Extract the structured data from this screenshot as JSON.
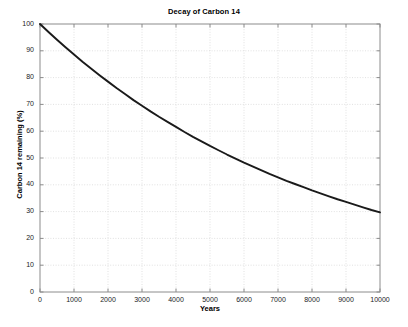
{
  "figure": {
    "background_color": "#ffffff",
    "axes_color": "#8c8c8c",
    "grid_color": "#d9d9d9",
    "line_color": "#1a1a1a",
    "text_color": "#000000"
  },
  "chart_data": {
    "type": "line",
    "title": "Decay of Carbon 14",
    "xlabel": "Years",
    "ylabel": "Carbon 14 remaining (%)",
    "xlim": [
      0,
      10000
    ],
    "ylim": [
      0,
      100
    ],
    "grid": true,
    "legend": null,
    "xticks": [
      0,
      1000,
      2000,
      3000,
      4000,
      5000,
      6000,
      7000,
      8000,
      9000,
      10000
    ],
    "xtick_labels": [
      "0",
      "1000",
      "2000",
      "3000",
      "4000",
      "5000",
      "6000",
      "7000",
      "8000",
      "9000",
      "10000"
    ],
    "yticks": [
      0,
      10,
      20,
      30,
      40,
      50,
      60,
      70,
      80,
      90,
      100
    ],
    "ytick_labels": [
      "0",
      "10",
      "20",
      "30",
      "40",
      "50",
      "60",
      "70",
      "80",
      "90",
      "100"
    ],
    "series": [
      {
        "name": "Carbon 14 remaining",
        "half_life_years": 5730,
        "color": "#1a1a1a",
        "line_width": 1.9,
        "x": [
          0,
          250,
          500,
          750,
          1000,
          1250,
          1500,
          1750,
          2000,
          2250,
          2500,
          2750,
          3000,
          3250,
          3500,
          3750,
          4000,
          4250,
          4500,
          4750,
          5000,
          5250,
          5500,
          5750,
          6000,
          6250,
          6500,
          6750,
          7000,
          7250,
          7500,
          7750,
          8000,
          8250,
          8500,
          8750,
          9000,
          9250,
          9500,
          9750,
          10000
        ],
        "y": [
          100.0,
          97.0,
          94.1,
          91.3,
          88.6,
          85.9,
          83.4,
          80.9,
          78.5,
          76.1,
          73.9,
          71.6,
          69.5,
          67.4,
          65.4,
          63.5,
          61.6,
          59.7,
          57.9,
          56.2,
          54.5,
          52.9,
          51.3,
          49.8,
          48.3,
          46.9,
          45.5,
          44.1,
          42.8,
          41.5,
          40.3,
          39.1,
          37.9,
          36.8,
          35.7,
          34.6,
          33.6,
          32.6,
          31.6,
          30.6,
          29.7
        ]
      }
    ]
  }
}
